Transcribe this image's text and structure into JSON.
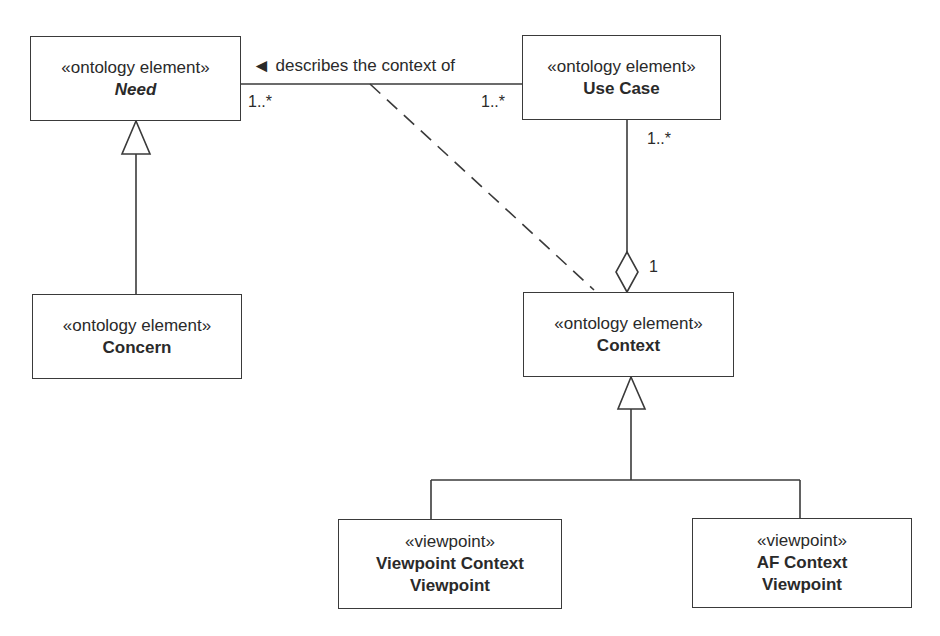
{
  "diagram": {
    "type": "uml-class-diagram",
    "elements": {
      "need": {
        "stereotype": "«ontology element»",
        "name": "Need",
        "abstract": true
      },
      "use_case": {
        "stereotype": "«ontology element»",
        "name": "Use Case"
      },
      "concern": {
        "stereotype": "«ontology element»",
        "name": "Concern"
      },
      "context": {
        "stereotype": "«ontology element»",
        "name": "Context"
      },
      "viewpoint_context_viewpoint": {
        "stereotype": "«viewpoint»",
        "name_line1": "Viewpoint Context",
        "name_line2": "Viewpoint"
      },
      "af_context_viewpoint": {
        "stereotype": "«viewpoint»",
        "name_line1": "AF Context",
        "name_line2": "Viewpoint"
      }
    },
    "relationships": {
      "need_usecase": {
        "kind": "association",
        "label": "describes the context of",
        "direction_arrow": "◄",
        "need_multiplicity": "1..*",
        "usecase_multiplicity": "1..*"
      },
      "usecase_context": {
        "kind": "aggregation",
        "usecase_multiplicity": "1..*",
        "context_multiplicity": "1"
      },
      "concern_need": {
        "kind": "generalization"
      },
      "context_association_class": {
        "kind": "association-class-link",
        "style": "dashed"
      },
      "viewpoints_context": {
        "kind": "generalization"
      }
    },
    "colors": {
      "line": "#3a3a3a",
      "text": "#2a2a2a",
      "background": "#ffffff"
    }
  }
}
